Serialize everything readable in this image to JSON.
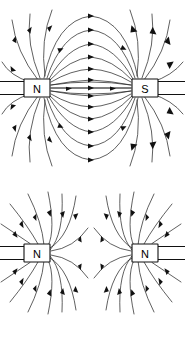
{
  "figure": {
    "width": 185,
    "height": 339,
    "background_color": "#ffffff",
    "line_color": "#2b2b2b",
    "label_color": "#000000"
  },
  "panels": [
    {
      "id": "attraction",
      "caption": "",
      "description": "unlike poles attract; field lines run from N to S",
      "magnets": [
        {
          "id": "top-left-magnet",
          "pole_label": "N",
          "side": "left",
          "box": {
            "x": 24,
            "y": 79,
            "w": 26,
            "h": 18
          }
        },
        {
          "id": "top-right-magnet",
          "pole_label": "S",
          "side": "right",
          "box": {
            "x": 132,
            "y": 79,
            "w": 26,
            "h": 18
          }
        }
      ]
    },
    {
      "id": "repulsion",
      "caption": "",
      "description": "like poles repel; field lines curve away with a neutral point between",
      "magnets": [
        {
          "id": "bottom-left-magnet",
          "pole_label": "N",
          "side": "left",
          "box": {
            "x": 24,
            "y": 244,
            "w": 26,
            "h": 18
          }
        },
        {
          "id": "bottom-right-magnet",
          "pole_label": "N",
          "side": "right",
          "box": {
            "x": 132,
            "y": 244,
            "w": 26,
            "h": 18
          }
        }
      ]
    }
  ]
}
